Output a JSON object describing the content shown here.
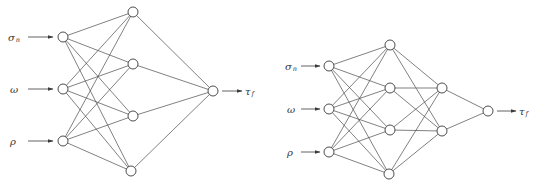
{
  "figure": {
    "networks": [
      {
        "id": "left-network",
        "description": "3-4-1 feedforward network",
        "layers": [
          {
            "name": "input",
            "nodes": [
              {
                "x": 63,
                "y": 37
              },
              {
                "x": 63,
                "y": 89
              },
              {
                "x": 63,
                "y": 141
              }
            ]
          },
          {
            "name": "hidden1",
            "nodes": [
              {
                "x": 133,
                "y": 12
              },
              {
                "x": 133,
                "y": 64
              },
              {
                "x": 133,
                "y": 116
              },
              {
                "x": 131,
                "y": 171
              }
            ]
          },
          {
            "name": "output",
            "nodes": [
              {
                "x": 213,
                "y": 91
              }
            ]
          }
        ],
        "inputs": [
          {
            "symbol": "σ",
            "subscript": "n",
            "x": 8,
            "y": 37
          },
          {
            "symbol": "ω",
            "subscript": "",
            "x": 10,
            "y": 89
          },
          {
            "symbol": "ρ",
            "subscript": "",
            "x": 10,
            "y": 141
          }
        ],
        "input_arrow": {
          "x1": 28,
          "x2": 53
        },
        "output": {
          "symbol": "τ",
          "subscript": "f",
          "arrow_x1": 222,
          "arrow_x2": 242,
          "label_x": 245
        }
      },
      {
        "id": "right-network",
        "description": "3-4-2-1 feedforward network",
        "layers": [
          {
            "name": "input",
            "nodes": [
              {
                "x": 329,
                "y": 66
              },
              {
                "x": 329,
                "y": 109
              },
              {
                "x": 329,
                "y": 152
              }
            ]
          },
          {
            "name": "hidden1",
            "nodes": [
              {
                "x": 390,
                "y": 45
              },
              {
                "x": 390,
                "y": 88
              },
              {
                "x": 390,
                "y": 130
              },
              {
                "x": 389,
                "y": 174
              }
            ]
          },
          {
            "name": "hidden2",
            "nodes": [
              {
                "x": 442,
                "y": 88
              },
              {
                "x": 442,
                "y": 131
              }
            ]
          },
          {
            "name": "output",
            "nodes": [
              {
                "x": 488,
                "y": 111
              }
            ]
          }
        ],
        "inputs": [
          {
            "symbol": "σ",
            "subscript": "n",
            "x": 285,
            "y": 66
          },
          {
            "symbol": "ω",
            "subscript": "",
            "x": 287,
            "y": 109
          },
          {
            "symbol": "ρ",
            "subscript": "",
            "x": 287,
            "y": 152
          }
        ],
        "input_arrow": {
          "x1": 301,
          "x2": 320
        },
        "output": {
          "symbol": "τ",
          "subscript": "f",
          "arrow_x1": 497,
          "arrow_x2": 516,
          "label_x": 519
        }
      }
    ],
    "node_radius": 5,
    "colors": {
      "line": "#4a4a4a",
      "node_stroke": "#3a3a3a",
      "node_fill": "#ffffff",
      "text": "#333333"
    }
  }
}
